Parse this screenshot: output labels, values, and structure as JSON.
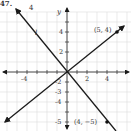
{
  "problem_number": "47.",
  "top_label": "4",
  "axes": {
    "x_label": "x",
    "y_label": "y",
    "x_ticks": [
      "-4",
      "2",
      "4"
    ],
    "y_ticks": [
      "4",
      "2",
      "-2",
      "-3",
      "-4",
      "-5"
    ],
    "xlim": [
      -6,
      6
    ],
    "ylim": [
      -6,
      6
    ]
  },
  "lines": [
    {
      "name": "line-through-5-4",
      "label": "",
      "point_label": "(5, 4)",
      "point": [
        5,
        4
      ],
      "slope": 0.8
    },
    {
      "name": "line-l",
      "label": "l",
      "point_label": "(4, −5)",
      "point": [
        4,
        -5
      ],
      "slope": -1.25
    }
  ],
  "colors": {
    "grid": "#d9d9d9",
    "axis": "#444444",
    "line": "#1a1a1a",
    "text": "#333333"
  }
}
